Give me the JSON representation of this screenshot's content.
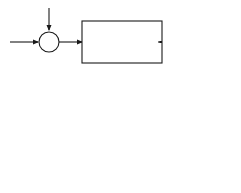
{
  "diagram_top": {
    "inputs": {
      "setpoint": "H",
      "setpoint_sub": "sc",
      "disturbance": "H",
      "disturbance_sub": "i"
    },
    "summer_symbol": "Σ",
    "feedback_sign": "–",
    "forward_block": {
      "numerator": "K",
      "numerator_sup": "p'",
      "denominator": "τ",
      "denominator_full": "τp' s + 1"
    },
    "forward_block_text": {
      "num": "Kp'",
      "den": "τp's + 1"
    },
    "signal_mid": {
      "name": "T",
      "sub": "o"
    },
    "second_block": {
      "num": "hfm Afm",
      "den": "Cm s"
    },
    "output": {
      "name": "T",
      "sub": "m"
    },
    "feedback_block": {
      "num": "τp s + 1",
      "den": "Kp"
    }
  },
  "diagram_bottom": {
    "inputs": {
      "setpoint": "H",
      "setpoint_sub": "sc",
      "disturbance": "H",
      "disturbance_sub": "i"
    },
    "summer_symbol": "Σ",
    "block": "KoGo(s)",
    "output": {
      "name": "T",
      "sub": "o"
    }
  },
  "colors": {
    "ink": "#1a1a1a",
    "background": "#ffffff"
  }
}
